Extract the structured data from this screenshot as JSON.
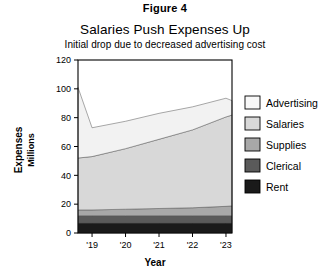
{
  "figure": {
    "label": "Figure 4"
  },
  "chart_data": {
    "type": "area",
    "stacked": true,
    "title": "Salaries Push Expenses Up",
    "subtitle": "Initial drop due to decreased advertising cost",
    "xlabel": "Year",
    "ylabel": "Expenses",
    "ylabel_secondary": "Millions",
    "grid": false,
    "legend_position": "right",
    "ylim": [
      0,
      120
    ],
    "yticks": [
      0,
      20,
      40,
      60,
      80,
      100,
      120
    ],
    "ytick_labels": [
      "0",
      "20",
      "40",
      "60",
      "80",
      "100",
      "120"
    ],
    "x": [
      "'19",
      "'20",
      "'21",
      "'22",
      "'23"
    ],
    "xtick_labels": [
      "'19",
      "'20",
      "'21",
      "'22",
      "'23"
    ],
    "x_start_offset": -0.42,
    "x_end_offset": 0.18,
    "series": [
      {
        "name": "Rent",
        "color": "#1a1a1a",
        "values_at_edges": [
          7,
          7,
          7,
          7,
          7,
          7,
          7
        ],
        "x_points": [
          -0.42,
          0,
          1,
          2,
          3,
          4,
          4.18
        ]
      },
      {
        "name": "Clerical",
        "color": "#5a5a5a",
        "values_at_edges": [
          5,
          5,
          5,
          5,
          5,
          5,
          5
        ],
        "x_points": [
          -0.42,
          0,
          1,
          2,
          3,
          4,
          4.18
        ]
      },
      {
        "name": "Supplies",
        "color": "#a8a8a8",
        "values_at_edges": [
          4,
          4,
          4.5,
          5,
          5.5,
          6.5,
          6.8
        ],
        "x_points": [
          -0.42,
          0,
          1,
          2,
          3,
          4,
          4.18
        ]
      },
      {
        "name": "Salaries",
        "color": "#d8d8d8",
        "values_at_edges": [
          36,
          37,
          42,
          48,
          54,
          62,
          63
        ],
        "x_points": [
          -0.42,
          0,
          1,
          2,
          3,
          4,
          4.18
        ]
      },
      {
        "name": "Advertising",
        "color": "#f2f2f2",
        "values_at_edges": [
          49,
          20,
          19,
          18,
          16,
          13,
          10
        ],
        "x_points": [
          -0.42,
          0,
          1,
          2,
          3,
          4,
          4.18
        ]
      }
    ],
    "totals": [
      101,
      73,
      77.5,
      83,
      87.5,
      93.5,
      91.8
    ],
    "legend_entries": [
      {
        "label": "Advertising",
        "color": "#f8f8f8"
      },
      {
        "label": "Salaries",
        "color": "#d8d8d8"
      },
      {
        "label": "Supplies",
        "color": "#a8a8a8"
      },
      {
        "label": "Clerical",
        "color": "#5a5a5a"
      },
      {
        "label": "Rent",
        "color": "#1a1a1a"
      }
    ]
  }
}
